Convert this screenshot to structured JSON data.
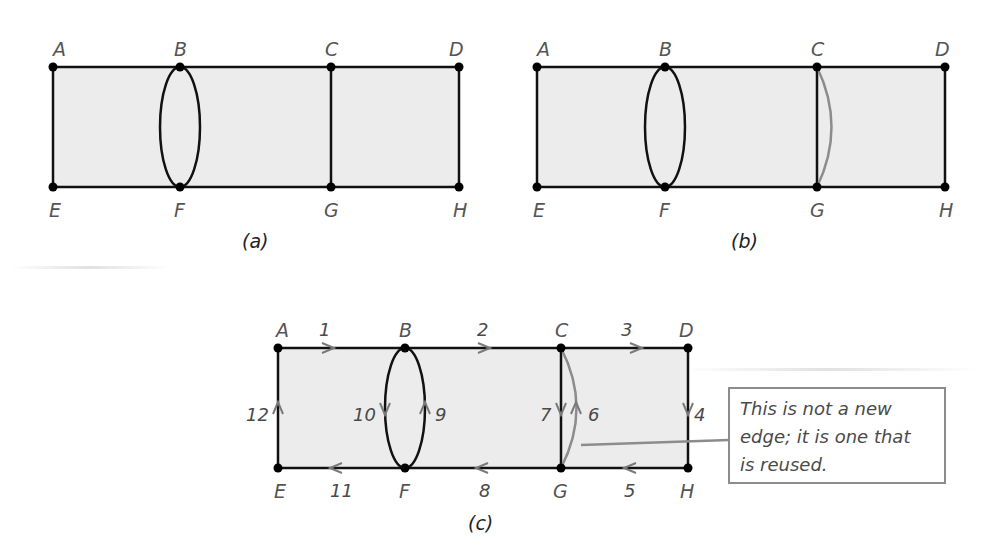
{
  "figure": {
    "panels": [
      {
        "id": "a",
        "caption": "(a)",
        "nodes": {
          "A": "A",
          "B": "B",
          "C": "C",
          "D": "D",
          "E": "E",
          "F": "F",
          "G": "G",
          "H": "H"
        },
        "description": "Graph with vertices A-H; double edge between B and F drawn as ellipse; single edge C-G"
      },
      {
        "id": "b",
        "caption": "(b)",
        "nodes": {
          "A": "A",
          "B": "B",
          "C": "C",
          "D": "D",
          "E": "E",
          "F": "F",
          "G": "G",
          "H": "H"
        },
        "description": "Same graph with an added gray (reused) edge between C and G"
      },
      {
        "id": "c",
        "caption": "(c)",
        "nodes": {
          "A": "A",
          "B": "B",
          "C": "C",
          "D": "D",
          "E": "E",
          "F": "F",
          "G": "G",
          "H": "H"
        },
        "edge_labels": {
          "e1": "1",
          "e2": "2",
          "e3": "3",
          "e4": "4",
          "e5": "5",
          "e6": "6",
          "e7": "7",
          "e8": "8",
          "e9": "9",
          "e10": "10",
          "e11": "11",
          "e12": "12"
        },
        "euler_circuit": [
          "A→B (1)",
          "B→C (2)",
          "C→D (3)",
          "D→H (4)",
          "H→G (5)",
          "G→C (6)",
          "C→G (7)",
          "G→F (8)",
          "F→B (9)",
          "B→F (10)",
          "F→E (11)",
          "E→A (12)"
        ],
        "callout": {
          "text_line1": "This is not a new",
          "text_line2": "edge; it is one that",
          "text_line3": "is reused."
        }
      }
    ],
    "colors": {
      "edge": "#111111",
      "reused_edge": "#8c8c8c",
      "arrow": "#7a7a7a",
      "fill": "#ececec",
      "node": "#000000"
    }
  }
}
